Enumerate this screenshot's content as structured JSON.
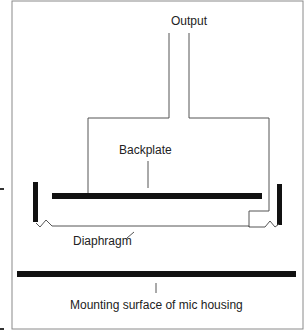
{
  "diagram": {
    "labels": {
      "output": "Output",
      "backplate": "Backplate",
      "diaphragm": "Diaphragm",
      "mounting": "Mounting surface of mic housing"
    },
    "colors": {
      "line": "#555555",
      "bar": "#111111",
      "frame": "#888888",
      "text": "#222222"
    }
  }
}
